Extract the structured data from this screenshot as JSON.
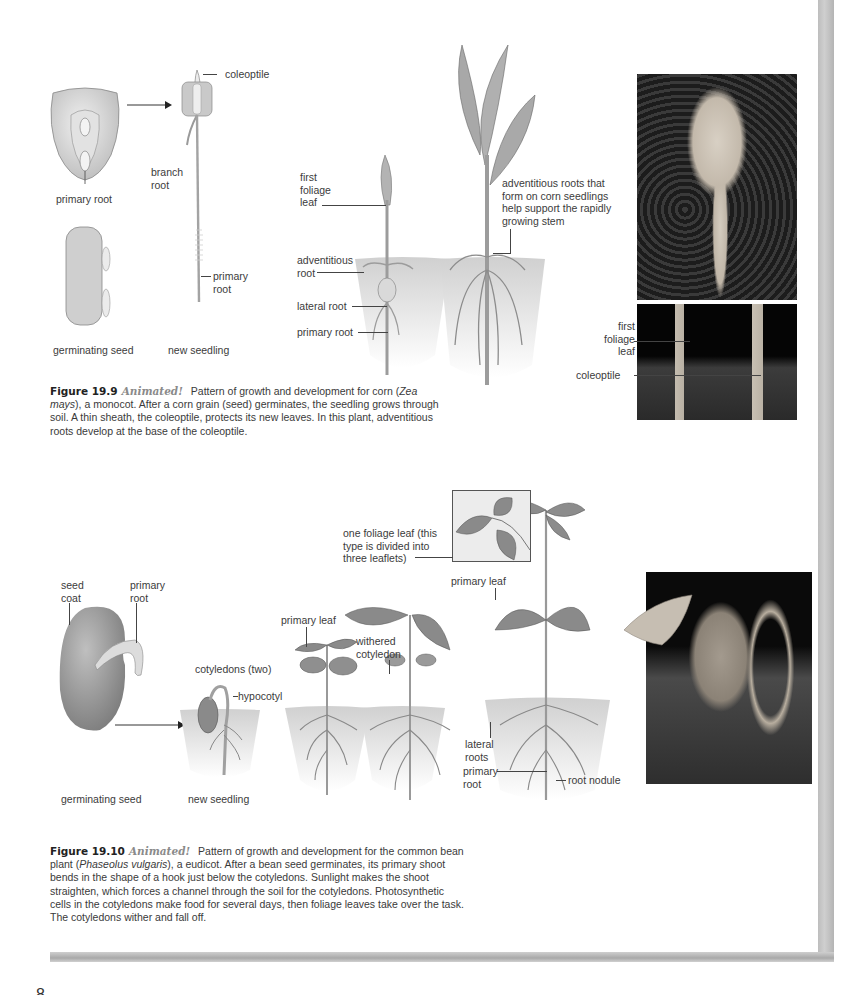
{
  "page": {
    "number": "8"
  },
  "figure_19_9": {
    "illustration_labels": {
      "coleoptile": "coleoptile",
      "branch_root": "branch\nroot",
      "primary_root_seed": "primary root",
      "primary_root_seedling": "primary\nroot",
      "germinating_seed": "germinating seed",
      "new_seedling": "new seedling",
      "first_foliage_leaf": "first\nfoliage\nleaf",
      "adventitious_root": "adventitious\nroot",
      "lateral_root": "lateral root",
      "primary_root_plant": "primary root",
      "adventitious_note": "adventitious roots that\nform on corn seedlings\nhelp support the rapidly\ngrowing stem"
    },
    "photo_labels": {
      "first_foliage_leaf": "first\nfoliage\nleaf",
      "coleoptile": "coleoptile"
    },
    "caption": {
      "figure_number": "Figure 19.9",
      "tag": "Animated!",
      "text_part1": "Pattern of growth and development for corn (",
      "species": "Zea mays",
      "text_part2": "), a monocot. After a corn grain (seed) germinates, the seedling grows through soil. A thin sheath, the coleoptile, protects its new leaves. In this plant, adventitious roots develop at the base of the coleoptile."
    }
  },
  "figure_19_10": {
    "illustration_labels": {
      "seed_coat": "seed\ncoat",
      "primary_root_seed": "primary\nroot",
      "cotyledons": "cotyledons (two)",
      "hypocotyl": "hypocotyl",
      "germinating_seed": "germinating seed",
      "new_seedling": "new seedling",
      "primary_leaf_small": "primary leaf",
      "withered_cotyledon": "withered\ncotyledon",
      "foliage_leaf_note": "one foliage leaf (this\ntype is divided into\nthree leaflets)",
      "primary_leaf_large": "primary leaf",
      "lateral_roots": "lateral\nroots",
      "primary_root_plant": "primary\nroot",
      "root_nodule": "root nodule"
    },
    "caption": {
      "figure_number": "Figure 19.10",
      "tag": "Animated!",
      "text_part1": "Pattern of growth and development for the common bean plant (",
      "species": "Phaseolus vulgaris",
      "text_part2": "), a eudicot. After a bean seed germinates, its primary shoot bends in the shape of a hook just below the cotyledons. Sunlight makes the shoot straighten, which forces a channel through the soil for the cotyledons. Photosynthetic cells in the cotyledons make food for several days, then foliage leaves take over the task. The cotyledons wither and fall off."
    }
  },
  "colors": {
    "text": "#3a3a3a",
    "figure_number": "#222222",
    "animated_tag": "#8a8a8a",
    "page_edge": "#bdbdbd",
    "soil": "#d6d6d6"
  }
}
